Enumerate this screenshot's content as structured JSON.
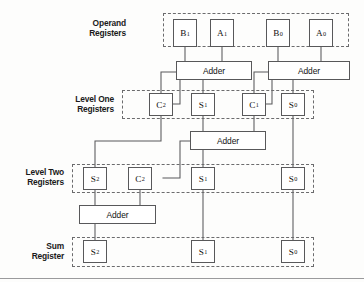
{
  "figure": {
    "type": "block-diagram",
    "width": 364,
    "height": 282,
    "background_color": "#fdfdfc",
    "line_color": "#58585a",
    "dash_color": "#6b6b6d",
    "text_color": "#111111"
  },
  "row_labels": [
    {
      "id": "operand",
      "line1": "Operand",
      "line2": "Registers",
      "text": "Operand\nRegisters"
    },
    {
      "id": "level-one",
      "line1": "Level One",
      "line2": "Registers",
      "text": "Level One\nRegisters"
    },
    {
      "id": "level-two",
      "line1": "Level Two",
      "line2": "Registers",
      "text": "Level Two\nRegisters"
    },
    {
      "id": "sum",
      "line1": "Sum",
      "line2": "Register",
      "text": "Sum\nRegister"
    }
  ],
  "adders": {
    "label": "Adder",
    "items": [
      {
        "id": "adder-top-left",
        "label": "Adder"
      },
      {
        "id": "adder-top-right",
        "label": "Adder"
      },
      {
        "id": "adder-mid",
        "label": "Adder"
      },
      {
        "id": "adder-bottom",
        "label": "Adder"
      }
    ]
  },
  "registers": {
    "operand": [
      {
        "id": "op-b1",
        "base": "B",
        "sub": "1"
      },
      {
        "id": "op-a1",
        "base": "A",
        "sub": "1"
      },
      {
        "id": "op-b0",
        "base": "B",
        "sub": "0"
      },
      {
        "id": "op-a0",
        "base": "A",
        "sub": "0"
      }
    ],
    "level_one": [
      {
        "id": "l1-c2",
        "base": "C",
        "sub": "2"
      },
      {
        "id": "l1-s1",
        "base": "S",
        "sub": "1"
      },
      {
        "id": "l1-c1",
        "base": "C",
        "sub": "1"
      },
      {
        "id": "l1-s0",
        "base": "S",
        "sub": "0"
      }
    ],
    "level_two": [
      {
        "id": "l2-s2",
        "base": "S",
        "sub": "2"
      },
      {
        "id": "l2-c2",
        "base": "C",
        "sub": "2"
      },
      {
        "id": "l2-s1",
        "base": "S",
        "sub": "1"
      },
      {
        "id": "l2-s0",
        "base": "S",
        "sub": "0"
      }
    ],
    "sum": [
      {
        "id": "sum-s2",
        "base": "S",
        "sub": "2"
      },
      {
        "id": "sum-s1",
        "base": "S",
        "sub": "1"
      },
      {
        "id": "sum-s0",
        "base": "S",
        "sub": "0"
      }
    ]
  }
}
